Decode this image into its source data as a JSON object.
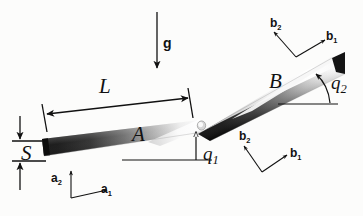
{
  "figure": {
    "background_color": "#fcfcfb",
    "ink_color": "#111111"
  },
  "labels": {
    "gravity": "g",
    "length": "L",
    "thickness": "S",
    "link_a": "A",
    "link_b": "B",
    "angle_1_base": "q",
    "angle_1_sub": "1",
    "angle_2_base": "q",
    "angle_2_sub": "2",
    "frame_a_x_base": "a",
    "frame_a_x_sub": "1",
    "frame_a_y_base": "a",
    "frame_a_y_sub": "2",
    "frame_b_x_base": "b",
    "frame_b_x_sub": "1",
    "frame_b_y_base": "b",
    "frame_b_y_sub": "2"
  },
  "elements": {
    "gravity_arrow": "downward arrow labeled g",
    "length_dimension": "double-headed arrow spanning link A labeled L",
    "thickness_dimension": "vertical dimension at left end labeled S",
    "beam_a": "shaded tapered beam A",
    "beam_b": "shaded tapered beam B",
    "joint": "revolute joint between A and B",
    "angle_arc_1": "arc from horizontal reference to beam A labeled q1",
    "angle_arc_2": "arc from horizontal reference to beam B labeled q2",
    "frame_a": "body-fixed axes a1, a2 at base",
    "frame_b_lower": "body-fixed axes b1, b2 below link B",
    "frame_b_upper": "body-fixed axes b1, b2 above link B"
  }
}
